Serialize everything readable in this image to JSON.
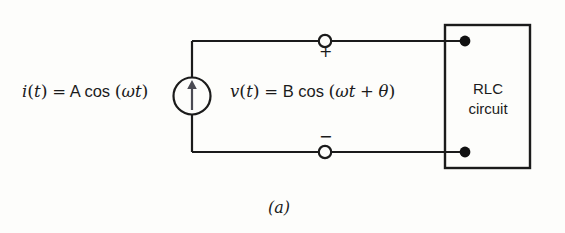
{
  "figure": {
    "caption": "(a)",
    "background_color": "#fdfdfb",
    "line_color": "#1b1b1b"
  },
  "source": {
    "type": "independent-current-source",
    "symbol": "circle-with-up-arrow",
    "expression": {
      "lhs_var": "i",
      "lhs_paren_open": "(",
      "lhs_arg": "t",
      "lhs_paren_close": ")",
      "equals": "=",
      "amplitude": "A",
      "function": "cos",
      "arg_paren_open": "(",
      "omega": "ω",
      "time": "t",
      "arg_paren_close": ")",
      "full_text": "i(t) = A cos (ωt)"
    }
  },
  "voltage": {
    "expression": {
      "lhs_var": "v",
      "lhs_paren_open": "(",
      "lhs_arg": "t",
      "lhs_paren_close": ")",
      "equals": "=",
      "amplitude": "B",
      "function": "cos",
      "arg_paren_open": "(",
      "omega": "ω",
      "time": "t",
      "plus": "+",
      "theta": "θ",
      "arg_paren_close": ")",
      "full_text": "v(t) = B cos (ωt + θ)"
    },
    "polarity_plus": "+",
    "polarity_minus": "−"
  },
  "load_block": {
    "line1": "RLC",
    "line2": "circuit"
  },
  "terminals": {
    "top_open_node": "open-terminal",
    "bottom_open_node": "open-terminal",
    "top_connection_dot": "filled-node",
    "bottom_connection_dot": "filled-node"
  }
}
